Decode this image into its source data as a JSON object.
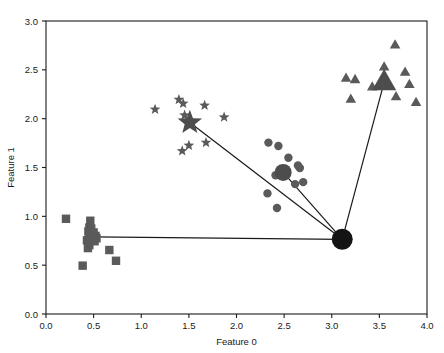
{
  "chart_data": {
    "type": "scatter",
    "title": "",
    "xlabel": "Feature 0",
    "ylabel": "Feature 1",
    "xlim": [
      0.0,
      4.0
    ],
    "ylim": [
      0.0,
      3.0
    ],
    "xticks": [
      "0.0",
      "0.5",
      "1.0",
      "1.5",
      "2.0",
      "2.5",
      "3.0",
      "3.5",
      "4.0"
    ],
    "xtick_values": [
      0.0,
      0.5,
      1.0,
      1.5,
      2.0,
      2.5,
      3.0,
      3.5,
      4.0
    ],
    "yticks": [
      "0.0",
      "0.5",
      "1.0",
      "1.5",
      "2.0",
      "2.5",
      "3.0"
    ],
    "ytick_values": [
      0.0,
      0.5,
      1.0,
      1.5,
      2.0,
      2.5,
      3.0
    ],
    "grid": false,
    "legend": "none",
    "marker_color": "#5a5a5a",
    "center_color": "#4d4d4d",
    "origin_color": "#141414",
    "line_color": "#1a1a1a",
    "series": [
      {
        "name": "cluster-squares",
        "marker": "square",
        "color": "#5a5a5a",
        "size": 4.2,
        "points": [
          [
            0.21,
            0.975
          ],
          [
            0.465,
            0.955
          ],
          [
            0.455,
            0.885
          ],
          [
            0.475,
            0.875
          ],
          [
            0.445,
            0.845
          ],
          [
            0.5,
            0.835
          ],
          [
            0.52,
            0.8
          ],
          [
            0.455,
            0.8
          ],
          [
            0.47,
            0.785
          ],
          [
            0.5,
            0.775
          ],
          [
            0.53,
            0.775
          ],
          [
            0.43,
            0.755
          ],
          [
            0.485,
            0.755
          ],
          [
            0.445,
            0.735
          ],
          [
            0.51,
            0.745
          ],
          [
            0.455,
            0.705
          ],
          [
            0.44,
            0.675
          ],
          [
            0.665,
            0.655
          ],
          [
            0.385,
            0.495
          ],
          [
            0.735,
            0.545
          ]
        ]
      },
      {
        "name": "cluster-stars",
        "marker": "star",
        "color": "#5a5a5a",
        "size": 4.2,
        "points": [
          [
            1.145,
            2.095
          ],
          [
            1.395,
            2.195
          ],
          [
            1.44,
            2.155
          ],
          [
            1.665,
            2.135
          ],
          [
            1.455,
            2.035
          ],
          [
            1.87,
            2.015
          ],
          [
            1.51,
            1.96
          ],
          [
            1.68,
            1.755
          ],
          [
            1.5,
            1.725
          ],
          [
            1.43,
            1.67
          ]
        ]
      },
      {
        "name": "cluster-circles",
        "marker": "circle",
        "color": "#5a5a5a",
        "size": 4.2,
        "points": [
          [
            2.335,
            1.755
          ],
          [
            2.44,
            1.72
          ],
          [
            2.545,
            1.6
          ],
          [
            2.645,
            1.52
          ],
          [
            2.665,
            1.495
          ],
          [
            2.495,
            1.45
          ],
          [
            2.41,
            1.42
          ],
          [
            2.615,
            1.33
          ],
          [
            2.7,
            1.35
          ],
          [
            2.325,
            1.235
          ],
          [
            2.425,
            1.085
          ]
        ]
      },
      {
        "name": "cluster-triangles",
        "marker": "triangle",
        "color": "#5a5a5a",
        "size": 4.6,
        "points": [
          [
            3.665,
            2.755
          ],
          [
            3.15,
            2.415
          ],
          [
            3.245,
            2.4
          ],
          [
            3.55,
            2.53
          ],
          [
            3.77,
            2.475
          ],
          [
            3.815,
            2.35
          ],
          [
            3.52,
            2.35
          ],
          [
            3.55,
            2.375
          ],
          [
            3.2,
            2.2
          ],
          [
            3.675,
            2.225
          ],
          [
            3.885,
            2.165
          ],
          [
            3.425,
            2.325
          ]
        ]
      }
    ],
    "centers": [
      {
        "name": "center-star",
        "marker": "star",
        "x": 1.51,
        "y": 1.96,
        "size": 9.5,
        "color": "#4d4d4d"
      },
      {
        "name": "center-circle",
        "marker": "circle",
        "x": 2.49,
        "y": 1.45,
        "size": 8.5,
        "color": "#4d4d4d"
      },
      {
        "name": "center-triangle",
        "marker": "triangle",
        "x": 3.55,
        "y": 2.375,
        "size": 10.5,
        "color": "#4d4d4d"
      },
      {
        "name": "origin-point",
        "marker": "circle",
        "x": 3.11,
        "y": 0.765,
        "size": 10.5,
        "color": "#141414"
      }
    ],
    "connections": [
      {
        "name": "line-origin-to-square-cluster",
        "from": [
          3.11,
          0.765
        ],
        "to": [
          0.5,
          0.79
        ]
      },
      {
        "name": "line-origin-to-star-center",
        "from": [
          3.11,
          0.765
        ],
        "to": [
          1.51,
          1.96
        ]
      },
      {
        "name": "line-origin-to-circle-center",
        "from": [
          3.11,
          0.765
        ],
        "to": [
          2.49,
          1.45
        ]
      },
      {
        "name": "line-origin-to-triangle-center",
        "from": [
          3.11,
          0.765
        ],
        "to": [
          3.55,
          2.375
        ]
      }
    ]
  }
}
